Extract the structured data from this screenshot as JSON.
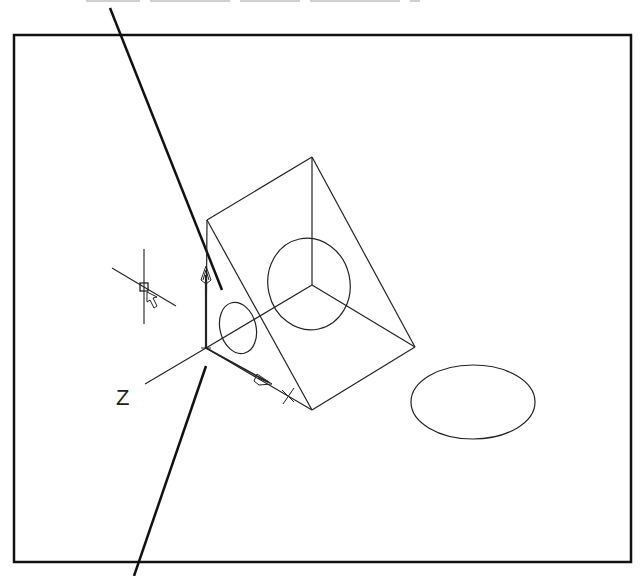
{
  "figure": {
    "caption_top": "",
    "viewport_frame": {
      "x": 14,
      "y": 35,
      "width": 617,
      "height": 527
    },
    "ucs_icon": {
      "origin": [
        206,
        348
      ],
      "axis_label": "Z",
      "y_arrow_end": [
        206,
        270
      ],
      "x_arrow_end": [
        268,
        382
      ],
      "z_axis_end": [
        145,
        384
      ],
      "x_marker": [
        288,
        396
      ]
    },
    "wedge": {
      "vertices": {
        "top": [
          312,
          157
        ],
        "left_top": [
          207,
          220
        ],
        "center": [
          312,
          285
        ],
        "right": [
          415,
          347
        ],
        "bottom": [
          312,
          410
        ],
        "origin": [
          206,
          348
        ]
      }
    },
    "circles": [
      {
        "name": "large-face-hole",
        "cx": 309,
        "cy": 284,
        "rx": 41,
        "ry": 46
      },
      {
        "name": "small-face-hole",
        "cx": 238,
        "cy": 328,
        "rx": 18,
        "ry": 26
      },
      {
        "name": "floor-ellipse",
        "cx": 473,
        "cy": 402,
        "rx": 62,
        "ry": 37
      }
    ],
    "leader_lines": [
      {
        "name": "top-leader",
        "from": [
          110,
          8
        ],
        "to": [
          222,
          290
        ]
      },
      {
        "name": "bottom-leader",
        "from": [
          206,
          366
        ],
        "to": [
          134,
          576
        ]
      }
    ],
    "cursor": {
      "crosshair_center": [
        144,
        287
      ]
    },
    "colors": {
      "line": "#222222",
      "frame": "#111111",
      "background": "#ffffff"
    }
  }
}
